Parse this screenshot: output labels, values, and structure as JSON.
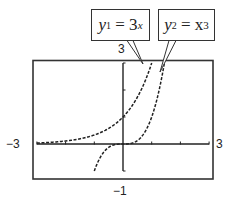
{
  "chart_data": {
    "type": "line",
    "title": "",
    "xlabel": "",
    "ylabel": "",
    "xlim": [
      -3,
      3
    ],
    "ylim": [
      -1,
      3
    ],
    "grid": false,
    "tick_labels": {
      "x_min": "−3",
      "x_max": "3",
      "y_min": "−1",
      "y_max": "3"
    },
    "x_ticks": [
      -3,
      -2,
      -1,
      0,
      1,
      2,
      3
    ],
    "y_ticks": [
      -1,
      0,
      1,
      2,
      3
    ],
    "series": [
      {
        "name": "y1 = 3^x",
        "label_parts": {
          "var": "y",
          "sub": "1",
          "eq": " = 3",
          "sup": "x"
        },
        "style": "dashed",
        "x": [
          -3,
          -2.5,
          -2,
          -1.5,
          -1,
          -0.5,
          0,
          0.25,
          0.5,
          0.75,
          1
        ],
        "y": [
          0.037,
          0.064,
          0.111,
          0.192,
          0.333,
          0.577,
          1,
          1.316,
          1.732,
          2.28,
          3
        ]
      },
      {
        "name": "y2 = x^3",
        "label_parts": {
          "var": "y",
          "sub": "2",
          "eq": " = x",
          "sup": "3"
        },
        "style": "dashed",
        "x": [
          -1,
          -0.75,
          -0.5,
          -0.25,
          0,
          0.25,
          0.5,
          0.75,
          1,
          1.25,
          1.44
        ],
        "y": [
          -1,
          -0.422,
          -0.125,
          -0.016,
          0,
          0.016,
          0.125,
          0.422,
          1,
          1.953,
          2.986
        ]
      }
    ],
    "annotations": [
      {
        "text": "y1 = 3^x",
        "type": "callout",
        "points_to": "y1 curve near top"
      },
      {
        "text": "y2 = x^3",
        "type": "callout",
        "points_to": "y2 curve near top"
      }
    ]
  },
  "colors": {
    "ink": "#222222",
    "frame": "#333333",
    "background": "#ffffff"
  }
}
